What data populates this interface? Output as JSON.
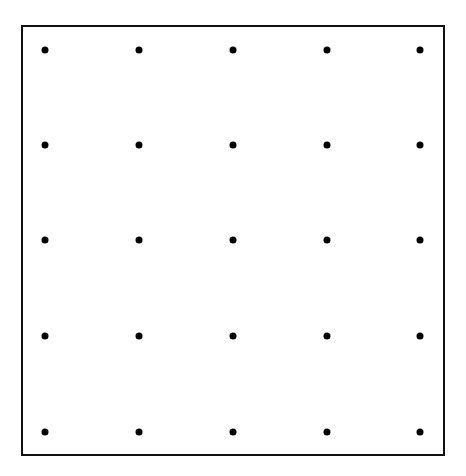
{
  "diagram": {
    "type": "dot-grid",
    "rows": 5,
    "columns": 5,
    "dot_color": "#000000",
    "border_color": "#111111",
    "column_x": [
      45,
      139,
      233,
      327,
      420
    ],
    "row_y": [
      50,
      145,
      240,
      336,
      432
    ]
  }
}
